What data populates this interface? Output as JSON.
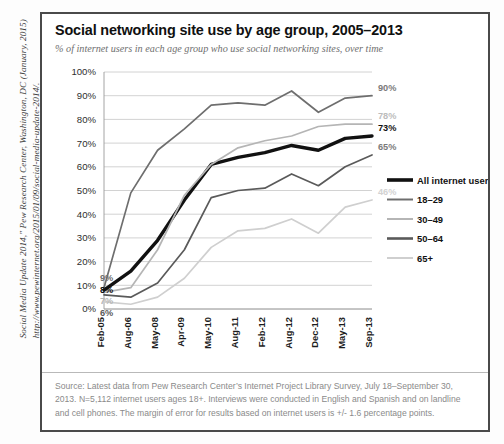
{
  "citation": "Social Media Update 2014,\" Pew Research Center, Washington, DC (January, 2015)\nhttp://www.pewinternet.org/2015/01/09/social-media-update-2014/.",
  "panel": {
    "title": "Social networking site use by age group, 2005–2013",
    "subtitle": "% of internet users in each age group who use social networking sites, over time",
    "source": "Source: Latest data from Pew Research Center’s Internet Project Library Survey, July 18–September 30, 2013. N=5,112 internet users ages 18+. Interviews were conducted in English and Spanish and on landline and cell phones. The margin of error for results based on internet users is +/- 1.6 percentage points."
  },
  "chart_data": {
    "type": "line",
    "title": "Social networking site use by age group, 2005–2013",
    "subtitle": "% of internet users in each age group who use social networking sites, over time",
    "xlabel": "",
    "ylabel": "",
    "ylim": [
      0,
      100
    ],
    "ytick_labels": [
      "100%",
      "90%",
      "80%",
      "70%",
      "60%",
      "50%",
      "40%",
      "30%",
      "20%",
      "10%",
      "0%"
    ],
    "ytick_values": [
      100,
      90,
      80,
      70,
      60,
      50,
      40,
      30,
      20,
      10,
      0
    ],
    "grid": true,
    "legend_position": "right",
    "categories": [
      "Feb-05",
      "Aug-06",
      "May-08",
      "Apr-09",
      "May-10",
      "Aug-11",
      "Feb-12",
      "Aug-12",
      "Dec-12",
      "May-13",
      "Sep-13"
    ],
    "series": [
      {
        "name": "All internet users",
        "color": "#111111",
        "width": 3.4,
        "values": [
          8,
          16,
          29,
          46,
          61,
          64,
          66,
          69,
          67,
          72,
          73
        ],
        "start_label": "8%",
        "end_label": "73%",
        "end_label_color": "#111111"
      },
      {
        "name": "18–29",
        "color": "#6e6e6e",
        "width": 1.7,
        "values": [
          9,
          49,
          67,
          76,
          86,
          87,
          86,
          92,
          83,
          89,
          90
        ],
        "start_label": "9%",
        "end_label": "90%",
        "end_label_color": "#7a7a7a"
      },
      {
        "name": "30–49",
        "color": "#b5b5b5",
        "width": 1.7,
        "values": [
          7,
          9,
          25,
          48,
          61,
          68,
          71,
          73,
          77,
          78,
          78
        ],
        "start_label": "7%",
        "end_label": "78%",
        "end_label_color": "#bcbcbc"
      },
      {
        "name": "50–64",
        "color": "#5a5a5a",
        "width": 1.7,
        "values": [
          6,
          5,
          11,
          25,
          47,
          50,
          51,
          57,
          52,
          60,
          65
        ],
        "start_label": "6%",
        "end_label": "65%",
        "end_label_color": "#7a7a7a"
      },
      {
        "name": "65+",
        "color": "#cfcfcf",
        "width": 1.7,
        "values": [
          3,
          2,
          5,
          13,
          26,
          33,
          34,
          38,
          32,
          43,
          46
        ],
        "start_label": "",
        "end_label": "46%",
        "end_label_color": "#d2d2d2"
      }
    ],
    "legend": [
      {
        "label": "All internet users",
        "color": "#111111",
        "width": 3.6
      },
      {
        "label": "18–29",
        "color": "#6e6e6e",
        "width": 2.0
      },
      {
        "label": "30–49",
        "color": "#b5b5b5",
        "width": 2.0
      },
      {
        "label": "50–64",
        "color": "#5a5a5a",
        "width": 2.6
      },
      {
        "label": "65+",
        "color": "#cfcfcf",
        "width": 2.0
      }
    ]
  }
}
